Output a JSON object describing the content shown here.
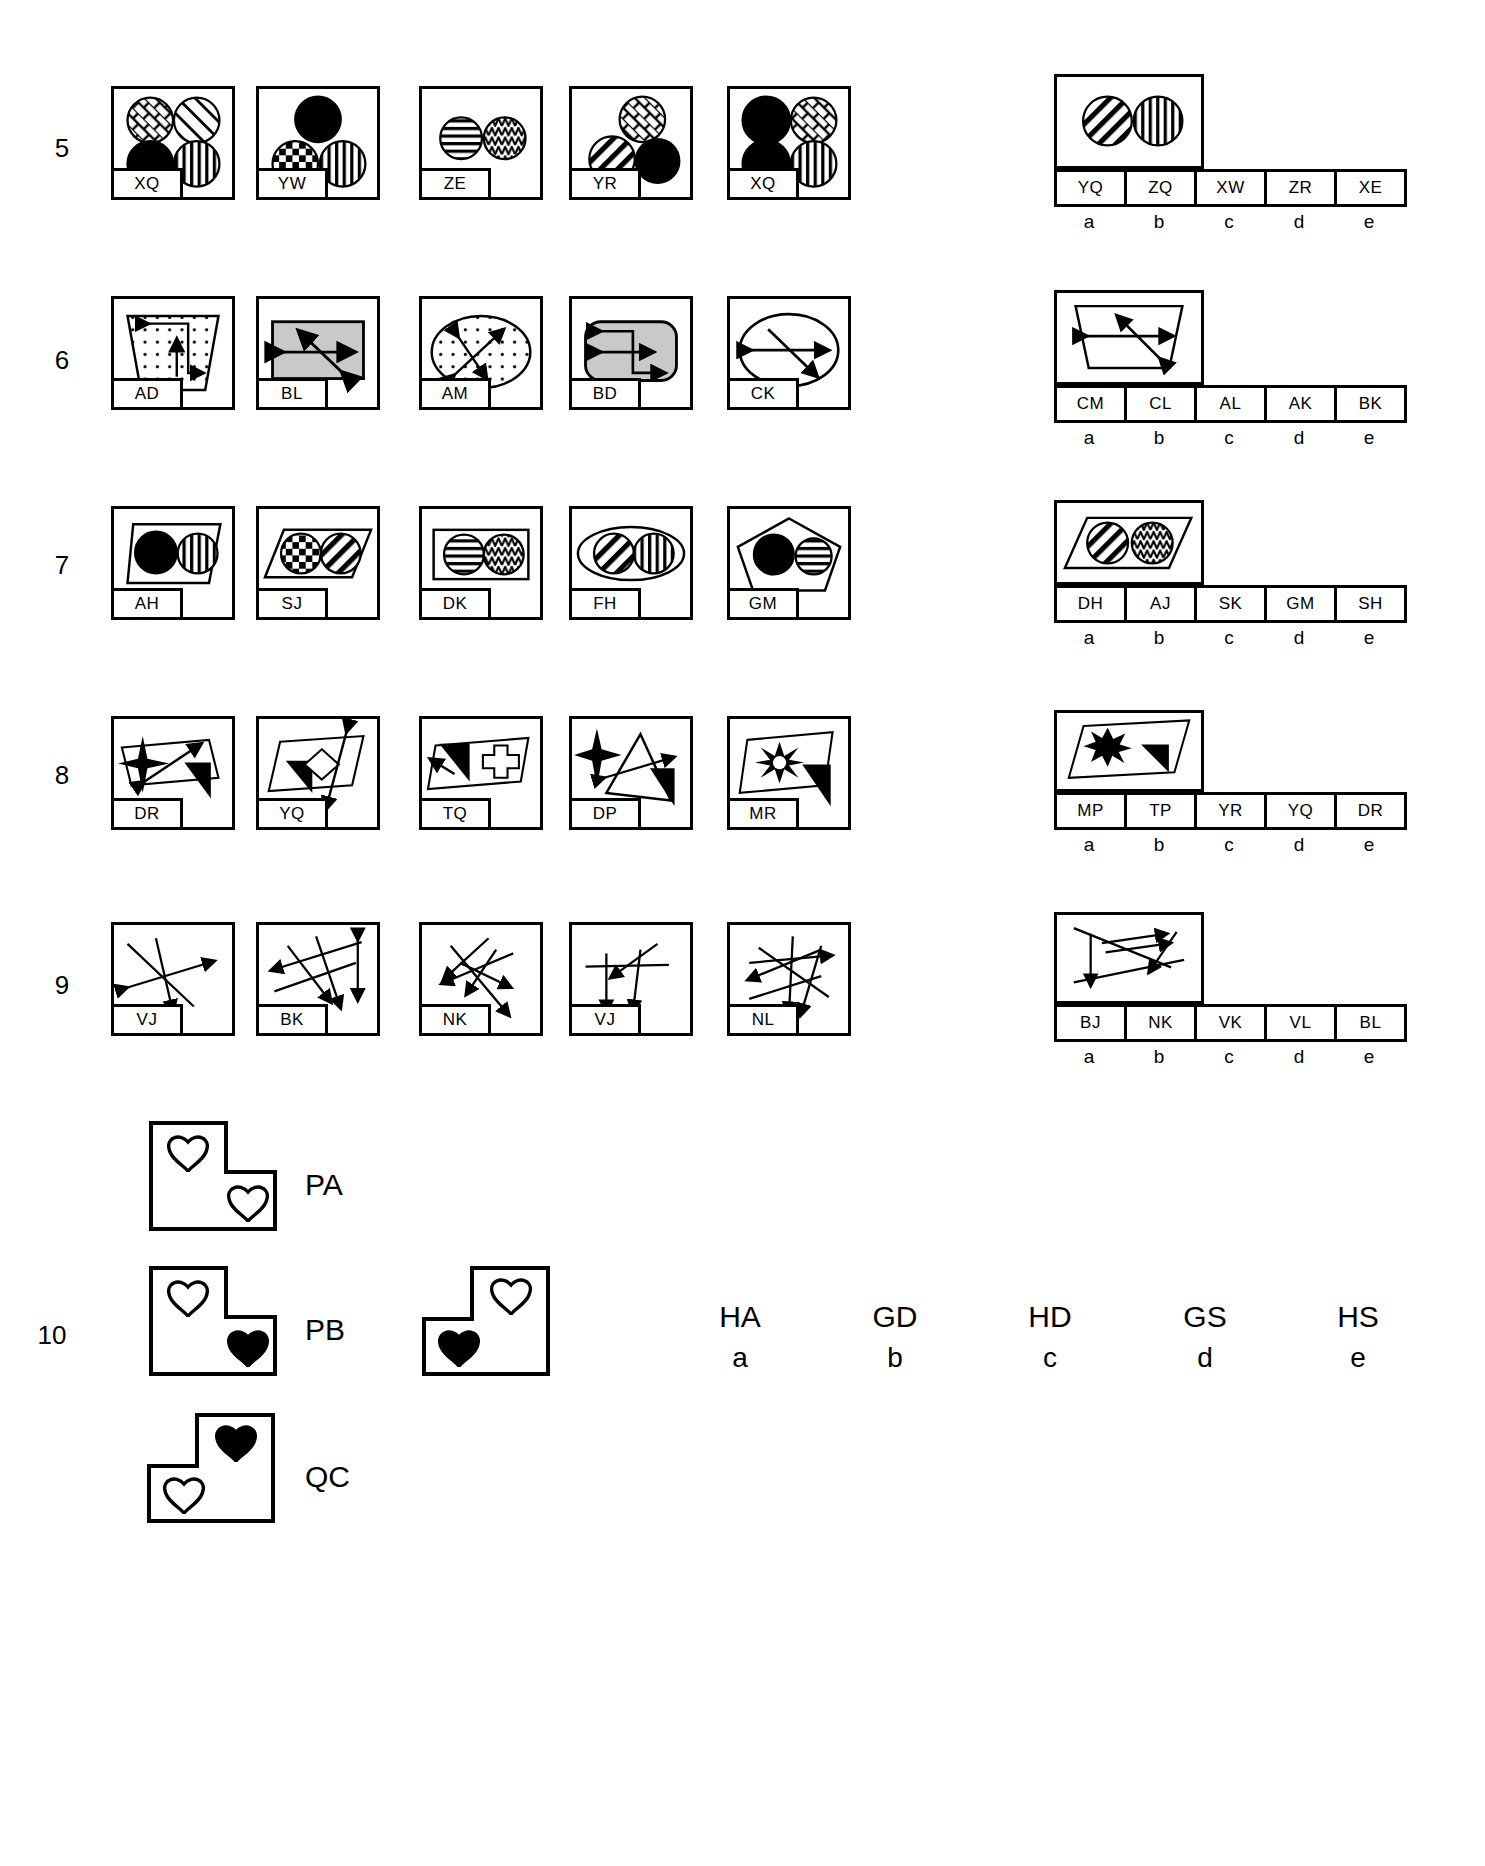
{
  "page": {
    "kind": "visual-reasoning-test-sheet",
    "background": "#ffffff",
    "ink": "#000000",
    "gray_fill": "#c9c9c9"
  },
  "rows": [
    {
      "number": "5",
      "panels": [
        {
          "tag": "XQ",
          "content": "four-circles-grid-crosshatch-diagonal-solid-vertical"
        },
        {
          "tag": "YW",
          "content": "three-circles-triangle-solid-checker-vertical"
        },
        {
          "tag": "ZE",
          "content": "two-circles-horizontal-zigzag"
        },
        {
          "tag": "YR",
          "content": "three-circles-crosshatch-diagonal-solid"
        },
        {
          "tag": "XQ",
          "content": "four-circles-grid-solid-crosshatch-solid-vertical"
        }
      ],
      "answer_figure": "two-circles-diagonal-vertical-in-rectangle",
      "options": [
        {
          "code": "YQ",
          "letter": "a"
        },
        {
          "code": "ZQ",
          "letter": "b"
        },
        {
          "code": "XW",
          "letter": "c"
        },
        {
          "code": "ZR",
          "letter": "d"
        },
        {
          "code": "XE",
          "letter": "e"
        }
      ]
    },
    {
      "number": "6",
      "panels": [
        {
          "tag": "AD",
          "content": "dotted-trapezoid-with-zigzag-arrows"
        },
        {
          "tag": "BL",
          "content": "gray-rectangle-with-double-arrows"
        },
        {
          "tag": "AM",
          "content": "dotted-ellipse-with-double-arrows"
        },
        {
          "tag": "BD",
          "content": "gray-rounded-rect-with-step-arrows"
        },
        {
          "tag": "CK",
          "content": "plain-ellipse-with-crossing-arrows"
        }
      ],
      "answer_figure": "trapezoid-with-crossing-double-arrows",
      "options": [
        {
          "code": "CM",
          "letter": "a"
        },
        {
          "code": "CL",
          "letter": "b"
        },
        {
          "code": "AL",
          "letter": "c"
        },
        {
          "code": "AK",
          "letter": "d"
        },
        {
          "code": "BK",
          "letter": "e"
        }
      ]
    },
    {
      "number": "7",
      "panels": [
        {
          "tag": "AH",
          "content": "trapezoid-with-solid-and-vertical-circles"
        },
        {
          "tag": "SJ",
          "content": "parallelogram-with-checker-and-diagonal-circles"
        },
        {
          "tag": "DK",
          "content": "rectangle-with-horizontal-and-zigzag-circles"
        },
        {
          "tag": "FH",
          "content": "ellipse-with-diagonal-and-vertical-circles"
        },
        {
          "tag": "GM",
          "content": "pentagon-with-solid-and-horizontal-circles"
        }
      ],
      "answer_figure": "parallelogram-with-diagonal-and-zigzag-circles",
      "options": [
        {
          "code": "DH",
          "letter": "a"
        },
        {
          "code": "AJ",
          "letter": "b"
        },
        {
          "code": "SK",
          "letter": "c"
        },
        {
          "code": "GM",
          "letter": "d"
        },
        {
          "code": "SH",
          "letter": "e"
        }
      ]
    },
    {
      "number": "8",
      "panels": [
        {
          "tag": "DR",
          "content": "four-point-star-arrow-and-solid-triangle"
        },
        {
          "tag": "YQ",
          "content": "parallelogram-diamond-solid-triangle-arrow"
        },
        {
          "tag": "TQ",
          "content": "parallelogram-cross-solid-triangle"
        },
        {
          "tag": "DP",
          "content": "star-triangle-outline-arrow"
        },
        {
          "tag": "MR",
          "content": "sunburst-star-parallelogram-solid-triangle"
        }
      ],
      "answer_figure": "burst-star-and-solid-triangle-in-parallelogram",
      "options": [
        {
          "code": "MP",
          "letter": "a"
        },
        {
          "code": "TP",
          "letter": "b"
        },
        {
          "code": "YR",
          "letter": "c"
        },
        {
          "code": "YQ",
          "letter": "d"
        },
        {
          "code": "DR",
          "letter": "e"
        }
      ]
    },
    {
      "number": "9",
      "panels": [
        {
          "tag": "VJ",
          "content": "crossing-arrows-three"
        },
        {
          "tag": "BK",
          "content": "crossing-arrows-five-diagonal"
        },
        {
          "tag": "NK",
          "content": "crossing-arrows-fan"
        },
        {
          "tag": "VJ",
          "content": "crossing-arrows-down-pair"
        },
        {
          "tag": "NL",
          "content": "crossing-arrows-dense"
        }
      ],
      "answer_figure": "crossing-arrows-spread",
      "options": [
        {
          "code": "BJ",
          "letter": "a"
        },
        {
          "code": "NK",
          "letter": "b"
        },
        {
          "code": "VK",
          "letter": "c"
        },
        {
          "code": "VL",
          "letter": "d"
        },
        {
          "code": "BL",
          "letter": "e"
        }
      ]
    }
  ],
  "row10": {
    "number": "10",
    "examples": [
      {
        "label": "PA",
        "shape": "L-polygon-notch-right",
        "hearts": [
          "outline",
          "outline"
        ]
      },
      {
        "label": "PB",
        "shape": "L-polygon-notch-right",
        "hearts": [
          "outline",
          "solid"
        ]
      },
      {
        "label": "QC",
        "shape": "L-polygon-notch-left",
        "hearts": [
          "solid",
          "outline"
        ]
      }
    ],
    "question_figure": {
      "shape": "L-polygon-notch-left",
      "hearts": [
        "outline",
        "solid"
      ]
    },
    "options": [
      {
        "code": "HA",
        "letter": "a"
      },
      {
        "code": "GD",
        "letter": "b"
      },
      {
        "code": "HD",
        "letter": "c"
      },
      {
        "code": "GS",
        "letter": "d"
      },
      {
        "code": "HS",
        "letter": "e"
      }
    ]
  }
}
